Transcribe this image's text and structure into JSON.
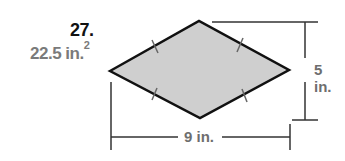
{
  "problem": {
    "number": "27.",
    "answer": "22.5 in.",
    "answer_exponent": "2"
  },
  "figure": {
    "shape": "rhombus",
    "fill_color": "#cfcfcf",
    "stroke_color": "#111111",
    "congruent_tick_marks": 4,
    "height_label": "5 in.",
    "width_label": "9 in."
  }
}
